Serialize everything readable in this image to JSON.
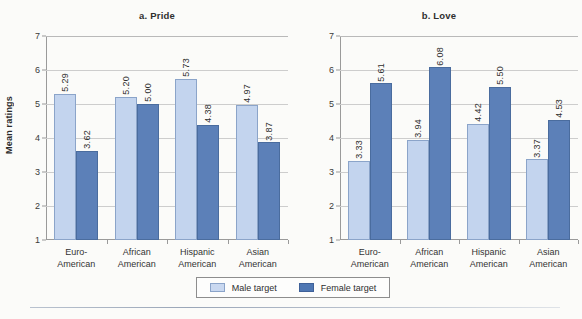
{
  "figure": {
    "background_color": "#fbfbf9",
    "panels": [
      {
        "id": "a",
        "title": "a. Pride",
        "ylabel": "Mean ratings"
      },
      {
        "id": "b",
        "title": "b. Love",
        "ylabel": ""
      }
    ]
  },
  "legend": {
    "items": [
      {
        "label": "Male target",
        "color": "#c9d8f0"
      },
      {
        "label": "Female target",
        "color": "#4f77b3"
      }
    ]
  },
  "axis": {
    "yticks": [
      "1",
      "2",
      "3",
      "4",
      "5",
      "6",
      "7"
    ],
    "ymin": 1,
    "ymax": 7
  },
  "categories": [
    {
      "line1": "Euro-",
      "line2": "American"
    },
    {
      "line1": "African",
      "line2": "American"
    },
    {
      "line1": "Hispanic",
      "line2": "American"
    },
    {
      "line1": "Asian",
      "line2": "American"
    }
  ],
  "chart_data": [
    {
      "type": "bar",
      "title": "a. Pride",
      "xlabel": "",
      "ylabel": "Mean ratings",
      "ylim": [
        1,
        7
      ],
      "ytick_step": 1,
      "grid": true,
      "legend_position": "bottom-center",
      "categories": [
        "Euro-American",
        "African American",
        "Hispanic American",
        "Asian American"
      ],
      "series": [
        {
          "name": "Male target",
          "color": "#c3d4ee",
          "values": [
            5.29,
            5.2,
            5.73,
            4.97
          ],
          "labels": [
            "5.29",
            "5.20",
            "5.73",
            "4.97"
          ]
        },
        {
          "name": "Female target",
          "color": "#5c80b8",
          "values": [
            3.62,
            5.0,
            4.38,
            3.87
          ],
          "labels": [
            "3.62",
            "5.00",
            "4.38",
            "3.87"
          ]
        }
      ]
    },
    {
      "type": "bar",
      "title": "b. Love",
      "xlabel": "",
      "ylabel": "",
      "ylim": [
        1,
        7
      ],
      "ytick_step": 1,
      "grid": true,
      "legend_position": "bottom-center",
      "categories": [
        "Euro-American",
        "African American",
        "Hispanic American",
        "Asian American"
      ],
      "series": [
        {
          "name": "Male target",
          "color": "#c3d4ee",
          "values": [
            3.33,
            3.94,
            4.42,
            3.37
          ],
          "labels": [
            "3.33",
            "3.94",
            "4.42",
            "3.37"
          ]
        },
        {
          "name": "Female target",
          "color": "#5c80b8",
          "values": [
            5.61,
            6.08,
            5.5,
            4.53
          ],
          "labels": [
            "5.61",
            "6.08",
            "5.50",
            "4.53"
          ]
        }
      ]
    }
  ]
}
